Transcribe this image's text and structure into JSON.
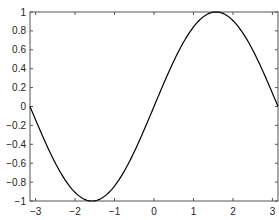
{
  "chart_data": {
    "type": "line",
    "title": "",
    "xlabel": "",
    "ylabel": "",
    "xlim": [
      -3.14159,
      3.14159
    ],
    "ylim": [
      -1,
      1
    ],
    "grid": false,
    "legend": null,
    "x_ticks": [
      -3,
      -2,
      -1,
      0,
      1,
      2,
      3
    ],
    "x_tick_labels": [
      "−3",
      "−2",
      "−1",
      "0",
      "1",
      "2",
      "3"
    ],
    "y_ticks": [
      -1,
      -0.8,
      -0.6,
      -0.4,
      -0.2,
      0,
      0.2,
      0.4,
      0.6,
      0.8,
      1
    ],
    "y_tick_labels": [
      "−1",
      "−0.8",
      "−0.6",
      "−0.4",
      "−0.2",
      "0",
      "0.2",
      "0.4",
      "0.6",
      "0.8",
      "1"
    ],
    "series": [
      {
        "name": "sin(x)",
        "color": "#000000",
        "function": "sin(x)",
        "x": [
          -3.14159,
          -2.5,
          -2.0,
          -1.5708,
          -1.0,
          -0.5,
          0.0,
          0.5,
          1.0,
          1.5708,
          2.0,
          2.5,
          3.14159
        ],
        "y": [
          0.0,
          -0.598,
          -0.909,
          -1.0,
          -0.841,
          -0.479,
          0.0,
          0.479,
          0.841,
          1.0,
          0.909,
          0.598,
          0.0
        ]
      }
    ]
  },
  "colors": {
    "axes": "#555555",
    "line": "#000000",
    "background": "#ffffff"
  }
}
